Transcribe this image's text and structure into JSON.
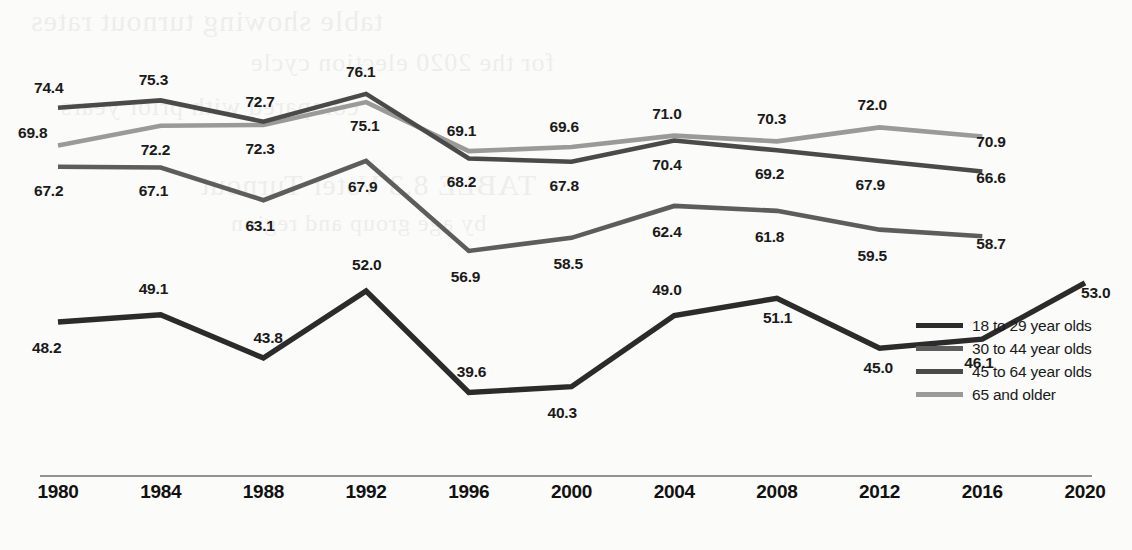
{
  "chart_data": {
    "type": "line",
    "title": "",
    "subtitle": "",
    "xlabel": "",
    "ylabel": "",
    "grid": false,
    "legend_position": "bottom-right",
    "ylim": [
      35,
      80
    ],
    "categories": [
      "1980",
      "1984",
      "1988",
      "1992",
      "1996",
      "2000",
      "2004",
      "2008",
      "2012",
      "2016",
      "2020"
    ],
    "series": [
      {
        "name": "18 to 29 year olds",
        "color": "#2b2b2b",
        "values": [
          48.2,
          49.1,
          43.8,
          52.0,
          39.6,
          40.3,
          49.0,
          51.1,
          45.0,
          46.1,
          53.0
        ],
        "labels": [
          "48.2",
          "49.1",
          "43.8",
          "52.0",
          "39.6",
          "40.3",
          "49.0",
          "51.1",
          "45.0",
          "46.1",
          "53.0"
        ]
      },
      {
        "name": "30 to 44 year olds",
        "color": "#5d5d5d",
        "values": [
          67.2,
          67.1,
          63.1,
          67.9,
          56.9,
          58.5,
          62.4,
          61.8,
          59.5,
          58.7,
          null
        ],
        "labels": [
          "67.2",
          "67.1",
          "63.1",
          "67.9",
          "56.9",
          "58.5",
          "62.4",
          "61.8",
          "59.5",
          "58.7"
        ]
      },
      {
        "name": "45 to 64 year olds",
        "color": "#4a4a4a",
        "values": [
          74.4,
          75.3,
          72.7,
          76.1,
          68.2,
          67.8,
          70.4,
          69.2,
          67.9,
          66.6,
          null
        ],
        "labels": [
          "74.4",
          "75.3",
          "72.7",
          "76.1",
          "68.2",
          "67.8",
          "70.4",
          "69.2",
          "67.9",
          "66.6"
        ]
      },
      {
        "name": "65 and older",
        "color": "#9a9a9a",
        "values": [
          69.8,
          72.2,
          72.3,
          75.1,
          69.1,
          69.6,
          71.0,
          70.3,
          72.0,
          70.9,
          null
        ],
        "labels": [
          "69.8",
          "72.2",
          "72.3",
          "75.1",
          "69.1",
          "69.6",
          "71.0",
          "70.3",
          "72.0",
          "70.9"
        ]
      }
    ]
  },
  "axis": {
    "ticks": [
      "1980",
      "1984",
      "1988",
      "1992",
      "1996",
      "2000",
      "2004",
      "2008",
      "2012",
      "2016",
      "2020"
    ]
  },
  "legend": {
    "items": [
      {
        "label": "18 to 29 year olds",
        "color": "#2b2b2b"
      },
      {
        "label": "30 to 44 year olds",
        "color": "#5d5d5d"
      },
      {
        "label": "45 to 64 year olds",
        "color": "#4a4a4a"
      },
      {
        "label": "65 and older",
        "color": "#9a9a9a"
      }
    ]
  },
  "ghost_text": [
    "table showing turnout rates",
    "for the 2020 election cycle",
    "compared with prior years",
    "TABLE 8.3 Voter Turnout",
    "by age group and region"
  ]
}
